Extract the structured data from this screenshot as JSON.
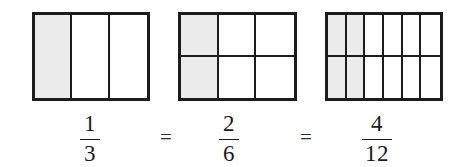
{
  "figure": {
    "border_color": "#1c1c1c",
    "shade_color": "#ebebeb",
    "background_color": "#ffffff"
  },
  "operators": {
    "equals_1": "=",
    "equals_2": "="
  },
  "models": [
    {
      "id": "model-thirds",
      "columns": 3,
      "rows": 1,
      "total_parts": 3,
      "shaded_parts": 1,
      "shaded_cells": [
        0
      ]
    },
    {
      "id": "model-sixths",
      "columns": 3,
      "rows": 2,
      "total_parts": 6,
      "shaded_parts": 2,
      "shaded_cells": [
        0,
        3
      ]
    },
    {
      "id": "model-twelfths",
      "columns": 6,
      "rows": 2,
      "total_parts": 12,
      "shaded_parts": 4,
      "shaded_cells": [
        0,
        1,
        6,
        7
      ]
    }
  ],
  "fractions": [
    {
      "id": "fraction-one-third",
      "numerator": "1",
      "denominator": "3"
    },
    {
      "id": "fraction-two-sixths",
      "numerator": "2",
      "denominator": "6"
    },
    {
      "id": "fraction-four-twelfths",
      "numerator": "4",
      "denominator": "12"
    }
  ],
  "chart_data": {
    "type": "bar",
    "categories": [
      "1/3",
      "2/6",
      "4/12"
    ],
    "values": [
      0.3333,
      0.3333,
      0.3333
    ],
    "series": [
      {
        "name": "total parts",
        "values": [
          3,
          6,
          12
        ]
      },
      {
        "name": "shaded parts",
        "values": [
          1,
          2,
          4
        ]
      }
    ],
    "xlabel": "",
    "ylabel": "fraction of whole shaded",
    "ylim": [
      0,
      1
    ],
    "grid": false,
    "legend": "none",
    "annotations": [
      "=",
      "="
    ]
  }
}
